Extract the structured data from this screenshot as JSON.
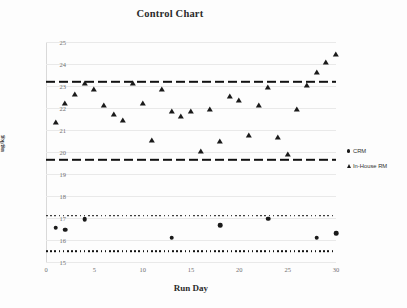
{
  "chart_data": {
    "type": "scatter",
    "title": "Control Chart",
    "xlabel": "Run Day",
    "ylabel": "ug/kg",
    "xlim": [
      0,
      30
    ],
    "ylim": [
      15,
      25
    ],
    "grid": true,
    "legend_position": "right",
    "x_ticks": [
      0,
      5,
      10,
      15,
      20,
      25,
      30
    ],
    "y_ticks": [
      15,
      16,
      17,
      18,
      19,
      20,
      21,
      22,
      23,
      24,
      25
    ],
    "series": [
      {
        "name": "In-House RM",
        "marker": "triangle",
        "x": [
          1,
          2,
          3,
          4,
          5,
          6,
          7,
          8,
          9,
          10,
          11,
          12,
          13,
          14,
          15,
          16,
          17,
          18,
          19,
          20,
          21,
          22,
          23,
          24,
          25,
          26,
          27,
          28,
          29,
          30
        ],
        "values": [
          21.3,
          22.2,
          22.6,
          23.1,
          22.8,
          22.1,
          21.7,
          21.4,
          23.1,
          22.2,
          20.5,
          22.8,
          21.8,
          21.6,
          21.8,
          20.0,
          21.9,
          20.45,
          22.5,
          22.3,
          20.75,
          22.1,
          22.9,
          20.65,
          19.85,
          21.9,
          23.0,
          23.6,
          24.05,
          24.4
        ]
      },
      {
        "name": "CRM",
        "marker": "circle",
        "x": [
          1,
          2,
          4,
          13,
          18,
          23,
          28,
          30
        ],
        "values": [
          16.55,
          16.47,
          16.95,
          16.1,
          16.67,
          16.97,
          16.1,
          16.3
        ]
      }
    ],
    "control_limits": [
      {
        "name": "In-House RM upper control limit",
        "value": 23.2,
        "style": "dashed"
      },
      {
        "name": "In-House RM lower control limit",
        "value": 19.65,
        "style": "dashed"
      },
      {
        "name": "CRM upper control limit",
        "value": 17.1,
        "style": "dotted"
      },
      {
        "name": "CRM lower control limit",
        "value": 15.5,
        "style": "dotted"
      }
    ]
  },
  "legend": {
    "entries": [
      {
        "label": "CRM",
        "marker": "circle"
      },
      {
        "label": "In-House RM",
        "marker": "triangle"
      }
    ]
  },
  "colors": {
    "marker": "#1a1a1a",
    "gridline": "#e9e9e9",
    "tick_text": "#707070",
    "title_text": "#2b2b2b",
    "background": "#fdfdfd"
  }
}
